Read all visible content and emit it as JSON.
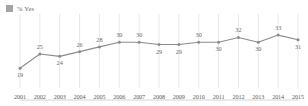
{
  "legend": {
    "entries": [
      {
        "label": "% Yes",
        "color": "#a6a3a8",
        "marker": "square"
      }
    ],
    "position": "top-left"
  },
  "chart_data": {
    "type": "line",
    "title": "",
    "subtitle": "",
    "xlabel": "",
    "ylabel": "",
    "categories": [
      "2001",
      "2002",
      "2003",
      "2004",
      "2005",
      "2006",
      "2007",
      "2008",
      "2009",
      "2010",
      "2011",
      "2012",
      "2013",
      "2014",
      "2015"
    ],
    "series": [
      {
        "name": "% Yes",
        "color": "#8c8a8f",
        "values": [
          19,
          25,
          24,
          26,
          28,
          30,
          30,
          29,
          29,
          30,
          30,
          32,
          30,
          33,
          31
        ],
        "labels": [
          "19",
          "25",
          "24",
          "26",
          "28",
          "30",
          "30",
          "29",
          "29",
          "30",
          "30",
          "32",
          "30",
          "33",
          "31"
        ],
        "label_positions": [
          "below",
          "above",
          "below",
          "above",
          "above",
          "above",
          "above",
          "below",
          "below",
          "above",
          "below",
          "above",
          "below",
          "above",
          "below"
        ]
      }
    ],
    "ylim": [
      14,
      36
    ],
    "grid": {
      "vertical": true,
      "horizontal": false
    },
    "axis": {
      "baseline": true,
      "ticks_visible": false
    },
    "legend_position": "top-left",
    "marker": "circle",
    "data_labels_shown": true
  },
  "colors": {
    "line": "#8c8a8f",
    "marker": "#8c8a8f",
    "gridline": "#e3e1e4",
    "baseline": "#cecccf",
    "label_text": "#6b686e",
    "axis_text": "#5f5c62",
    "background": "#ffffff"
  }
}
